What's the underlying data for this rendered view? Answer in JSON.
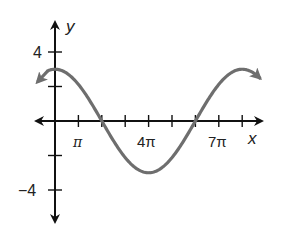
{
  "chart_data": {
    "type": "line",
    "title": "",
    "xlabel": "x",
    "ylabel": "y",
    "function": "y = 3cos(x/4)",
    "x_tick_labels": [
      "π",
      "4π",
      "7π"
    ],
    "x_tick_values_in_pi": [
      1,
      2,
      3,
      4,
      5,
      6,
      7,
      8
    ],
    "y_tick_labels": [
      "4",
      "−4"
    ],
    "y_tick_values": [
      4,
      2,
      -2,
      -4
    ],
    "xlim_in_pi": [
      -1,
      9
    ],
    "ylim": [
      -5.5,
      5
    ],
    "grid": false,
    "series": [
      {
        "name": "curve",
        "x_in_pi": [
          -0.6,
          0,
          1,
          2,
          3,
          4,
          5,
          6,
          7,
          8,
          8.5
        ],
        "values": [
          2.98,
          3,
          2.77,
          0,
          -2.12,
          -3,
          -2.12,
          0,
          2.12,
          3,
          2.94
        ]
      }
    ],
    "colors": {
      "axis": "#111111",
      "curve": "#6e6e6e"
    }
  },
  "axes": {
    "x_label": "x",
    "y_label": "y"
  },
  "ticks": {
    "x_pi": "π",
    "x_4pi": "4π",
    "x_7pi": "7π",
    "y_4": "4",
    "y_neg4": "−4"
  }
}
